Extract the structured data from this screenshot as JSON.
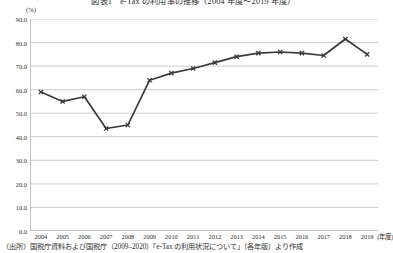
{
  "chart_data": {
    "type": "line",
    "title": "図表1　e-Tax の利用率の推移（2004 年度〜2019 年度）",
    "subtitle": "",
    "xlabel": "(年度)",
    "ylabel": "(%)",
    "unit_label": "(%)",
    "x_unit_label": "(年度)",
    "categories": [
      "2004",
      "2005",
      "2006",
      "2007",
      "2008",
      "2009",
      "2010",
      "2011",
      "2012",
      "2013",
      "2014",
      "2015",
      "2016",
      "2017",
      "2018",
      "2019"
    ],
    "values": [
      59.0,
      55.0,
      57.0,
      43.5,
      45.0,
      64.0,
      67.0,
      69.0,
      71.5,
      74.0,
      75.5,
      76.0,
      75.5,
      74.5,
      81.5,
      75.0
    ],
    "series": [
      {
        "name": "利用率",
        "values": [
          59.0,
          55.0,
          57.0,
          43.5,
          45.0,
          64.0,
          67.0,
          69.0,
          71.5,
          74.0,
          75.5,
          76.0,
          75.5,
          74.5,
          81.5,
          75.0
        ],
        "color": "#3a3a3a",
        "marker": "cross"
      }
    ],
    "ylim": [
      0.0,
      90.0
    ],
    "ytick_step": 10.0,
    "yticks": [
      "0.0",
      "10.0",
      "20.0",
      "30.0",
      "40.0",
      "50.0",
      "60.0",
      "70.0",
      "80.0",
      "90.0"
    ],
    "ytick_values": [
      0.0,
      10.0,
      20.0,
      30.0,
      40.0,
      50.0,
      60.0,
      70.0,
      80.0,
      90.0
    ],
    "grid": true,
    "grid_axis": "y",
    "legend": false,
    "legend_position": "none",
    "line_color": "#3a3a3a",
    "grid_color": "#c9c9c9",
    "axis_color": "#8c8c8c"
  },
  "source_note": "（出所）国税庁資料および国税庁（2009–2020）「e-Tax の利用状況について」（各年版）より作成"
}
